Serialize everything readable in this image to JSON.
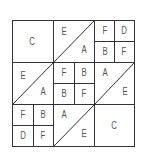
{
  "puzzle": {
    "grid_size": "3x3 blocks",
    "line_color": "#333333",
    "text_color": "#555555",
    "blocks": [
      {
        "row": 0,
        "col": 0,
        "type": "single",
        "label": "C"
      },
      {
        "row": 0,
        "col": 1,
        "type": "diagonal",
        "top_left": "E",
        "bottom_right": "A"
      },
      {
        "row": 0,
        "col": 2,
        "type": "quad",
        "cells": [
          "F",
          "D",
          "B",
          "F"
        ]
      },
      {
        "row": 1,
        "col": 0,
        "type": "diagonal",
        "top_left": "E",
        "bottom_right": "A"
      },
      {
        "row": 1,
        "col": 1,
        "type": "quad",
        "cells": [
          "F",
          "B",
          "B",
          "F"
        ]
      },
      {
        "row": 1,
        "col": 2,
        "type": "diagonal",
        "top_left": "A",
        "bottom_right": "E"
      },
      {
        "row": 2,
        "col": 0,
        "type": "quad",
        "cells": [
          "F",
          "B",
          "D",
          "F"
        ]
      },
      {
        "row": 2,
        "col": 1,
        "type": "diagonal",
        "top_left": "A",
        "bottom_right": "E"
      },
      {
        "row": 2,
        "col": 2,
        "type": "single",
        "label": "C"
      }
    ]
  }
}
